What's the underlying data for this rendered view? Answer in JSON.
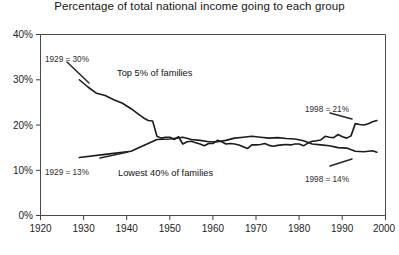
{
  "chart_data": {
    "type": "line",
    "title": "Percentage of total national income going to each group",
    "xlabel": "",
    "ylabel": "",
    "xlim": [
      1920,
      2000
    ],
    "ylim": [
      0,
      40
    ],
    "grid": false,
    "legend_position": "inline-annotations",
    "xticks": [
      "1920",
      "1930",
      "1940",
      "1950",
      "1960",
      "1970",
      "1980",
      "1990",
      "2000"
    ],
    "xtick_values": [
      1920,
      1930,
      1940,
      1950,
      1960,
      1970,
      1980,
      1990,
      2000
    ],
    "yticks": [
      "0%",
      "10%",
      "20%",
      "30%",
      "40%"
    ],
    "ytick_values": [
      0,
      10,
      20,
      30,
      40
    ],
    "series": [
      {
        "name": "Top 5% of families",
        "x": [
          1929,
          1931,
          1933,
          1935,
          1937,
          1939,
          1941,
          1943,
          1944,
          1945,
          1946,
          1947,
          1948,
          1949,
          1950,
          1951,
          1952,
          1953,
          1954,
          1955,
          1956,
          1957,
          1958,
          1959,
          1960,
          1961,
          1962,
          1963,
          1964,
          1965,
          1966,
          1967,
          1968,
          1969,
          1970,
          1971,
          1972,
          1973,
          1974,
          1975,
          1976,
          1977,
          1978,
          1979,
          1980,
          1981,
          1982,
          1983,
          1984,
          1985,
          1986,
          1987,
          1988,
          1989,
          1990,
          1991,
          1992,
          1993,
          1994,
          1995,
          1996,
          1997,
          1998
        ],
        "values": [
          30.0,
          28.4,
          27.0,
          26.5,
          25.6,
          24.8,
          23.6,
          22.2,
          21.5,
          21.0,
          20.9,
          17.5,
          17.1,
          17.3,
          17.3,
          16.8,
          17.4,
          15.8,
          16.3,
          16.4,
          16.1,
          15.8,
          15.4,
          15.9,
          15.9,
          16.6,
          16.3,
          15.8,
          15.9,
          15.8,
          15.6,
          15.2,
          14.8,
          15.6,
          15.6,
          15.7,
          15.9,
          15.5,
          15.3,
          15.5,
          15.6,
          15.7,
          15.6,
          15.8,
          15.8,
          15.4,
          16.0,
          16.4,
          16.5,
          16.7,
          17.5,
          17.3,
          17.2,
          17.9,
          17.4,
          17.1,
          17.6,
          20.3,
          20.1,
          20.0,
          20.3,
          20.7,
          21.0
        ]
      },
      {
        "name": "Lowest 40% of families",
        "x": [
          1929,
          1935,
          1941,
          1947,
          1950,
          1953,
          1955,
          1957,
          1959,
          1961,
          1963,
          1965,
          1967,
          1969,
          1971,
          1973,
          1975,
          1977,
          1979,
          1981,
          1983,
          1985,
          1987,
          1989,
          1991,
          1993,
          1995,
          1997,
          1998
        ],
        "values": [
          12.8,
          13.5,
          14.2,
          16.8,
          16.9,
          17.3,
          16.8,
          16.6,
          16.3,
          16.3,
          16.6,
          17.1,
          17.3,
          17.5,
          17.3,
          17.1,
          17.2,
          17.0,
          16.9,
          16.5,
          15.8,
          15.6,
          15.4,
          15.0,
          14.9,
          14.2,
          14.1,
          14.3,
          14.0
        ]
      }
    ],
    "annotations": [
      {
        "text": "1929 = 30%",
        "series": "Top 5% of families",
        "x": 1929,
        "value": 30
      },
      {
        "text": "1998 = 21%",
        "series": "Top 5% of families",
        "x": 1998,
        "value": 21
      },
      {
        "text": "1929 = 13%",
        "series": "Lowest 40% of families",
        "x": 1929,
        "value": 13
      },
      {
        "text": "1998 = 14%",
        "series": "Lowest 40% of families",
        "x": 1998,
        "value": 14
      }
    ]
  },
  "chart": {
    "title": "Percentage of total national income going to each group",
    "series_label_top": "Top 5% of families",
    "series_label_bottom": "Lowest 40% of families",
    "annotation_top_left": "1929 = 30%",
    "annotation_top_right": "1998 = 21%",
    "annotation_bottom_left": "1929 = 13%",
    "annotation_bottom_right": "1998 = 14%",
    "ytick_0": "0%",
    "ytick_1": "10%",
    "ytick_2": "20%",
    "ytick_3": "30%",
    "ytick_4": "40%",
    "xtick_0": "1920",
    "xtick_1": "1930",
    "xtick_2": "1940",
    "xtick_3": "1950",
    "xtick_4": "1960",
    "xtick_5": "1970",
    "xtick_6": "1980",
    "xtick_7": "1990",
    "xtick_8": "2000",
    "line_color": "#1b1b1b",
    "axis_color": "#4a4a4a",
    "background_color": "#ffffff"
  }
}
